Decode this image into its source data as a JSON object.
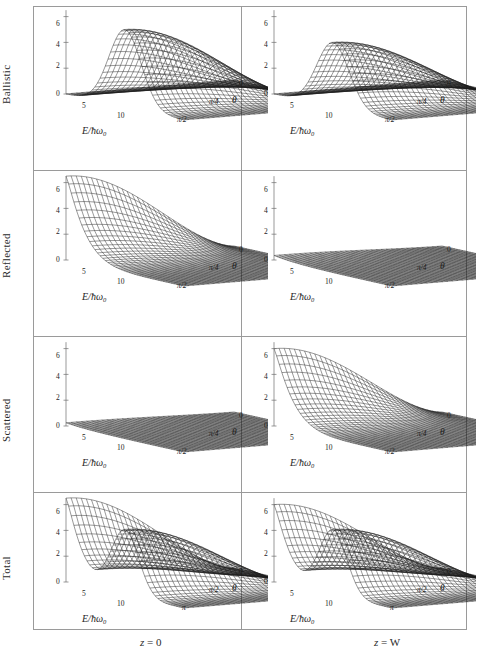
{
  "figure": {
    "type": "grid-of-3d-surface-plots",
    "rows": 4,
    "cols": 2,
    "background": "#ffffff",
    "frame_color": "#9a9a9a",
    "mesh_color": "#1a1a1a"
  },
  "row_labels": [
    {
      "id": "ballistic",
      "label": "Ballistic"
    },
    {
      "id": "reflected",
      "label": "Reflected"
    },
    {
      "id": "scattered",
      "label": "Scattered"
    },
    {
      "id": "total",
      "label": "Total"
    }
  ],
  "col_labels": [
    {
      "id": "z0",
      "label_var": "z",
      "label_eq": " = 0",
      "label_full": "z = 0"
    },
    {
      "id": "zW",
      "label_var": "z",
      "label_eq": " = W",
      "label_full": "z = W"
    }
  ],
  "axes": {
    "x": {
      "label_num": "E",
      "label_den": "ħω",
      "label_sub": "0",
      "label_full": "E/ħω₀",
      "ticks": [
        "0",
        "5",
        "10"
      ],
      "range": [
        0,
        14
      ]
    },
    "y_quarter": {
      "label": "θ",
      "ticks": [
        "0",
        "π/4",
        "π/2"
      ],
      "range_label": "0 to π/2"
    },
    "y_half": {
      "label": "θ",
      "ticks": [
        "0",
        "π/2",
        "π"
      ],
      "range_label": "0 to π"
    },
    "z": {
      "ticks": [
        "0",
        "2",
        "4",
        "6"
      ],
      "range": [
        0,
        6.5
      ]
    }
  },
  "chart_data": {
    "type": "surface",
    "title": "",
    "xlabel": "E/ħω₀",
    "ylabel": "θ",
    "zlabel": "",
    "xlim": [
      0,
      14
    ],
    "zlim": [
      0,
      6.5
    ],
    "grid": false,
    "legend": "none",
    "panels": [
      {
        "row": "Ballistic",
        "col": "z = 0",
        "theta_ticks": [
          "0",
          "π/4",
          "π/2"
        ],
        "theta_max_label": "π/2",
        "description": "Single broad Gaussian ridge peaking near E/ħω₀ = 7, height ~6 at θ = 0, decaying toward θ = π/2.",
        "peak_value": 6.0,
        "peak_x": 7.0,
        "peak_theta": 0.0,
        "baseline": 0.0
      },
      {
        "row": "Ballistic",
        "col": "z = W",
        "theta_ticks": [
          "0",
          "π/4",
          "π/2"
        ],
        "theta_max_label": "π/2",
        "description": "Single Gaussian ridge, lower and broader than z = 0, peak ~5 near E/ħω₀ = 7.",
        "peak_value": 5.0,
        "peak_x": 7.0,
        "peak_theta": 0.0,
        "baseline": 0.0
      },
      {
        "row": "Reflected",
        "col": "z = 0",
        "theta_ticks": [
          "0",
          "π/4",
          "π/2"
        ],
        "theta_max_label": "π/2",
        "description": "Sharp divergence at low E: surface rises steeply above 6 as E approaches 0, decaying monotonically with E and with θ.",
        "peak_value": 6.5,
        "peak_x": 0.5,
        "peak_theta": 0.0,
        "baseline": 0.0
      },
      {
        "row": "Reflected",
        "col": "z = W",
        "theta_ticks": [
          "0",
          "π/4",
          "π/2"
        ],
        "theta_max_label": "π/2",
        "description": "Nearly flat plane close to zero across the whole domain.",
        "peak_value": 0.35,
        "peak_x": 2.0,
        "peak_theta": 0.0,
        "baseline": 0.0
      },
      {
        "row": "Scattered",
        "col": "z = 0",
        "theta_ticks": [
          "0",
          "π/4",
          "π/2"
        ],
        "theta_max_label": "π/2",
        "description": "Nearly flat plane at zero across the whole domain.",
        "peak_value": 0.25,
        "peak_x": 2.0,
        "peak_theta": 0.0,
        "baseline": 0.0
      },
      {
        "row": "Scattered",
        "col": "z = W",
        "theta_ticks": [
          "0",
          "π/4",
          "π/2"
        ],
        "theta_max_label": "π/2",
        "description": "Steep rise at low E reaching ~6, falling off monotonically with increasing E and θ.",
        "peak_value": 6.0,
        "peak_x": 0.8,
        "peak_theta": 0.0,
        "baseline": 0.0
      },
      {
        "row": "Total",
        "col": "z = 0",
        "theta_ticks": [
          "0",
          "π/2",
          "π"
        ],
        "theta_max_label": "π",
        "description": "Two features: a steep low-E divergence ridge above 6 plus a secondary Gaussian peak near E/ħω₀ = 7, separated by a valley; surface flattens for θ beyond π/2.",
        "peak_value": 6.5,
        "peak_x": 0.5,
        "secondary_peak_value": 5.0,
        "secondary_peak_x": 7.0,
        "baseline": 0.0
      },
      {
        "row": "Total",
        "col": "z = W",
        "theta_ticks": [
          "0",
          "π/2",
          "π"
        ],
        "theta_max_label": "π",
        "description": "Two features: a low-E divergence ridge reaching ~6 plus a Gaussian peak near E/ħω₀ = 7 of height ~5, with a valley between; flat beyond θ = π/2.",
        "peak_value": 6.0,
        "peak_x": 0.6,
        "secondary_peak_value": 5.0,
        "secondary_peak_x": 7.0,
        "baseline": 0.0
      }
    ]
  }
}
